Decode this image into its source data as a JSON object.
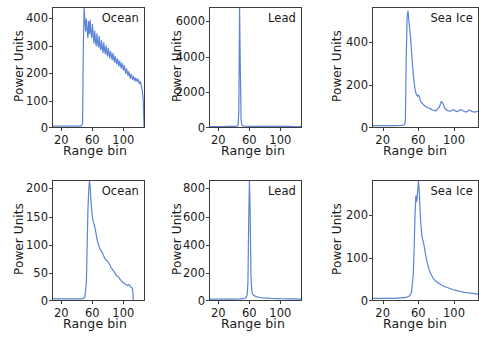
{
  "figure": {
    "axis_label_x": "Range bin",
    "axis_label_y": "Power Units",
    "line_color": "#5b84d6",
    "axis_color": "#3c3c3c",
    "background": "#ffffff"
  },
  "chart_data": [
    {
      "type": "line",
      "panel_index": 0,
      "row": "top",
      "column": 0,
      "title": "Ocean",
      "xlabel": "Range bin",
      "ylabel": "Power Units",
      "xlim": [
        8,
        128
      ],
      "ylim": [
        0,
        440
      ],
      "xticks": [
        20,
        60,
        100
      ],
      "yticks": [
        0,
        100,
        200,
        300,
        400
      ],
      "grid": false,
      "legend": "none",
      "series": [
        {
          "name": "Ocean waveform (top)",
          "x": [
            8,
            12,
            16,
            20,
            24,
            28,
            32,
            36,
            40,
            44,
            45,
            46,
            47,
            48,
            49,
            50,
            51,
            52,
            53,
            54,
            55,
            56,
            57,
            58,
            59,
            60,
            61,
            62,
            63,
            64,
            65,
            66,
            67,
            68,
            69,
            70,
            71,
            72,
            73,
            74,
            75,
            76,
            77,
            78,
            79,
            80,
            81,
            82,
            83,
            84,
            85,
            86,
            87,
            88,
            89,
            90,
            91,
            92,
            93,
            94,
            95,
            96,
            97,
            98,
            99,
            100,
            101,
            102,
            103,
            104,
            105,
            106,
            107,
            108,
            109,
            110,
            111,
            112,
            113,
            114,
            115,
            116,
            117,
            118,
            119,
            120,
            121,
            122,
            123,
            124,
            125,
            126,
            127,
            128
          ],
          "y": [
            3,
            3,
            3,
            3,
            3,
            3,
            3,
            3,
            3,
            3,
            4,
            6,
            12,
            300,
            440,
            395,
            355,
            400,
            360,
            330,
            390,
            345,
            395,
            350,
            330,
            380,
            340,
            310,
            355,
            320,
            300,
            345,
            312,
            295,
            335,
            300,
            285,
            320,
            292,
            275,
            312,
            285,
            270,
            300,
            278,
            262,
            292,
            270,
            255,
            280,
            262,
            248,
            272,
            255,
            240,
            262,
            246,
            232,
            252,
            238,
            225,
            244,
            230,
            218,
            236,
            222,
            210,
            228,
            212,
            198,
            215,
            202,
            190,
            205,
            192,
            180,
            196,
            185,
            175,
            188,
            178,
            170,
            182,
            175,
            168,
            178,
            170,
            160,
            168,
            158,
            145,
            130,
            100,
            0
          ]
        }
      ]
    },
    {
      "type": "line",
      "panel_index": 1,
      "row": "top",
      "column": 1,
      "title": "Lead",
      "xlabel": "Range bin",
      "ylabel": "Power Units",
      "xlim": [
        8,
        128
      ],
      "ylim": [
        0,
        6800
      ],
      "xticks": [
        20,
        60,
        100
      ],
      "yticks": [
        0,
        2000,
        4000,
        6000
      ],
      "grid": false,
      "legend": "none",
      "series": [
        {
          "name": "Lead waveform (top)",
          "x": [
            8,
            16,
            24,
            32,
            40,
            44,
            45,
            46,
            47,
            48,
            49,
            50,
            51,
            52,
            54,
            56,
            60,
            64,
            70,
            76,
            82,
            88,
            94,
            100,
            106,
            112,
            118,
            124,
            128
          ],
          "y": [
            30,
            30,
            30,
            32,
            35,
            45,
            90,
            900,
            6800,
            3200,
            420,
            110,
            70,
            55,
            45,
            42,
            40,
            38,
            36,
            35,
            34,
            33,
            32,
            32,
            31,
            31,
            30,
            30,
            28
          ]
        }
      ]
    },
    {
      "type": "line",
      "panel_index": 2,
      "row": "top",
      "column": 2,
      "title": "Sea Ice",
      "xlabel": "Range bin",
      "ylabel": "Power Units",
      "xlim": [
        8,
        128
      ],
      "ylim": [
        0,
        560
      ],
      "xticks": [
        20,
        60,
        100
      ],
      "yticks": [
        0,
        200,
        400
      ],
      "grid": false,
      "legend": "none",
      "series": [
        {
          "name": "Sea Ice waveform (top)",
          "x": [
            8,
            16,
            24,
            32,
            40,
            44,
            45,
            46,
            47,
            48,
            49,
            50,
            51,
            52,
            53,
            54,
            55,
            56,
            57,
            58,
            59,
            60,
            61,
            62,
            63,
            64,
            65,
            66,
            68,
            70,
            72,
            74,
            76,
            78,
            80,
            82,
            84,
            86,
            88,
            90,
            92,
            94,
            96,
            98,
            100,
            102,
            104,
            106,
            108,
            110,
            112,
            114,
            116,
            118,
            120,
            122,
            124,
            126,
            128
          ],
          "y": [
            6,
            6,
            6,
            6,
            7,
            10,
            30,
            330,
            520,
            545,
            500,
            460,
            420,
            360,
            300,
            250,
            210,
            180,
            160,
            150,
            145,
            150,
            140,
            125,
            118,
            112,
            108,
            104,
            98,
            92,
            88,
            84,
            80,
            78,
            76,
            86,
            95,
            120,
            110,
            88,
            80,
            76,
            74,
            78,
            82,
            76,
            72,
            76,
            82,
            78,
            74,
            70,
            74,
            80,
            76,
            72,
            70,
            72,
            74
          ]
        }
      ]
    },
    {
      "type": "line",
      "panel_index": 3,
      "row": "bottom",
      "column": 0,
      "title": "Ocean",
      "xlabel": "Range bin",
      "ylabel": "Power Units",
      "xlim": [
        8,
        128
      ],
      "ylim": [
        0,
        215
      ],
      "xticks": [
        20,
        60,
        100
      ],
      "yticks": [
        0,
        50,
        100,
        150,
        200
      ],
      "grid": false,
      "legend": "none",
      "series": [
        {
          "name": "Ocean waveform (bottom)",
          "x": [
            8,
            16,
            24,
            32,
            40,
            46,
            48,
            50,
            52,
            53,
            54,
            55,
            56,
            57,
            58,
            59,
            60,
            61,
            62,
            63,
            64,
            65,
            66,
            67,
            68,
            69,
            70,
            72,
            74,
            76,
            78,
            80,
            82,
            84,
            86,
            88,
            90,
            92,
            94,
            96,
            98,
            100,
            102,
            104,
            106,
            108,
            110,
            112,
            113,
            114
          ],
          "y": [
            2,
            2,
            2,
            2,
            2,
            2,
            3,
            5,
            30,
            95,
            160,
            196,
            215,
            205,
            180,
            162,
            150,
            142,
            138,
            132,
            126,
            118,
            110,
            104,
            100,
            96,
            92,
            88,
            82,
            76,
            72,
            70,
            66,
            60,
            56,
            52,
            48,
            44,
            42,
            38,
            35,
            32,
            30,
            28,
            26,
            28,
            24,
            22,
            20,
            0
          ]
        }
      ]
    },
    {
      "type": "line",
      "panel_index": 4,
      "row": "bottom",
      "column": 1,
      "title": "Lead",
      "xlabel": "Range bin",
      "ylabel": "Power Units",
      "xlim": [
        8,
        128
      ],
      "ylim": [
        0,
        860
      ],
      "xticks": [
        20,
        60,
        100
      ],
      "yticks": [
        0,
        200,
        400,
        600,
        800
      ],
      "grid": false,
      "legend": "none",
      "series": [
        {
          "name": "Lead waveform (bottom)",
          "x": [
            8,
            16,
            24,
            32,
            40,
            48,
            54,
            56,
            57,
            58,
            59,
            60,
            61,
            62,
            63,
            64,
            65,
            66,
            68,
            70,
            74,
            78,
            84,
            90,
            96,
            104,
            112,
            120,
            128
          ],
          "y": [
            6,
            6,
            6,
            6,
            7,
            8,
            12,
            20,
            40,
            120,
            560,
            860,
            620,
            180,
            70,
            46,
            38,
            32,
            26,
            22,
            18,
            15,
            13,
            11,
            10,
            9,
            8,
            8,
            7
          ]
        }
      ]
    },
    {
      "type": "line",
      "panel_index": 5,
      "row": "bottom",
      "column": 2,
      "title": "Sea Ice",
      "xlabel": "Range bin",
      "ylabel": "Power Units",
      "xlim": [
        8,
        128
      ],
      "ylim": [
        0,
        280
      ],
      "xticks": [
        20,
        60,
        100
      ],
      "yticks": [
        0,
        100,
        200
      ],
      "grid": false,
      "legend": "none",
      "series": [
        {
          "name": "Sea Ice waveform (bottom)",
          "x": [
            8,
            16,
            24,
            32,
            40,
            46,
            50,
            52,
            54,
            55,
            56,
            57,
            58,
            59,
            60,
            61,
            62,
            63,
            64,
            65,
            66,
            67,
            68,
            70,
            72,
            74,
            76,
            78,
            80,
            84,
            88,
            92,
            96,
            100,
            104,
            108,
            112,
            116,
            120,
            124,
            128
          ],
          "y": [
            4,
            4,
            4,
            4,
            5,
            6,
            10,
            18,
            60,
            120,
            200,
            245,
            232,
            255,
            280,
            250,
            200,
            170,
            150,
            140,
            132,
            120,
            108,
            88,
            72,
            62,
            54,
            48,
            44,
            38,
            33,
            30,
            27,
            24,
            22,
            20,
            18,
            17,
            16,
            15,
            14
          ]
        }
      ]
    }
  ],
  "panels": [
    {
      "label": "Ocean",
      "xlabel": "Range bin",
      "ylabel": "Power Units",
      "yticks": [
        "400",
        "300",
        "200",
        "100",
        "0"
      ],
      "xticks": [
        "20",
        "60",
        "100"
      ]
    },
    {
      "label": "Lead",
      "xlabel": "Range bin",
      "ylabel": "Power Units",
      "yticks": [
        "6000",
        "4000",
        "2000",
        "0"
      ],
      "xticks": [
        "20",
        "60",
        "100"
      ]
    },
    {
      "label": "Sea Ice",
      "xlabel": "Range bin",
      "ylabel": "Power Units",
      "yticks": [
        "400",
        "200",
        "0"
      ],
      "xticks": [
        "20",
        "60",
        "100"
      ]
    },
    {
      "label": "Ocean",
      "xlabel": "Range bin",
      "ylabel": "Power Units",
      "yticks": [
        "200",
        "150",
        "100",
        "50",
        "0"
      ],
      "xticks": [
        "20",
        "60",
        "100"
      ]
    },
    {
      "label": "Lead",
      "xlabel": "Range bin",
      "ylabel": "Power Units",
      "yticks": [
        "800",
        "600",
        "400",
        "200",
        "0"
      ],
      "xticks": [
        "20",
        "60",
        "100"
      ]
    },
    {
      "label": "Sea Ice",
      "xlabel": "Range bin",
      "ylabel": "Power Units",
      "yticks": [
        "200",
        "100",
        "0"
      ],
      "xticks": [
        "20",
        "60",
        "100"
      ]
    }
  ]
}
